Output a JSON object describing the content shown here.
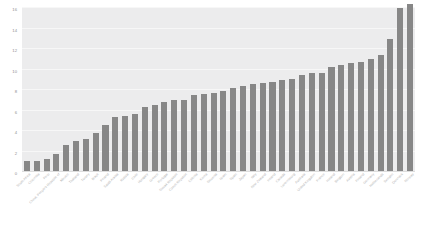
{
  "chart_data": {
    "type": "bar",
    "title": "",
    "subtitle": "",
    "xlabel": "",
    "ylabel": "",
    "ylim": [
      0,
      16
    ],
    "yticks": [
      0,
      2,
      4,
      6,
      8,
      10,
      12,
      14,
      16
    ],
    "grid": true,
    "legend": false,
    "legend_position": "none",
    "orientation": "vertical",
    "sorted": "ascending",
    "bar_color": "#878787",
    "panel_color": "#ececed",
    "gridline_color": "#f7f7f7",
    "tick_label_color": "#b4b4b4",
    "x_label_rotation": -45,
    "categories": [
      "South Africa",
      "Colombia",
      "Peru",
      "China, People's Republic of",
      "Mexico",
      "Thailand",
      "Turkey",
      "Brazil",
      "Poland",
      "Saudi Arabia",
      "Russia",
      "Chile",
      "Hungary",
      "Greece",
      "Portugal",
      "Slovak Republic",
      "Czech Republic",
      "Estonia",
      "Korea",
      "Slovenia",
      "Israel",
      "Spain",
      "Japan",
      "Italy",
      "New Zealand",
      "Ireland",
      "Canada",
      "Luxembourg",
      "Australia",
      "United Kingdom",
      "France",
      "Iceland",
      "Belgium",
      "Austria",
      "Finland",
      "Germany",
      "Netherlands",
      "Sweden",
      "Denmark",
      "Norway"
    ],
    "values": [
      1.1,
      1.1,
      1.3,
      1.8,
      2.6,
      3.0,
      3.2,
      3.8,
      4.6,
      5.4,
      5.5,
      5.7,
      6.3,
      6.5,
      6.8,
      7.0,
      7.0,
      7.5,
      7.6,
      7.7,
      7.9,
      8.2,
      8.4,
      8.6,
      8.7,
      8.8,
      9.0,
      9.1,
      9.5,
      9.7,
      9.7,
      10.2,
      10.4,
      10.6,
      10.7,
      11.0,
      11.4,
      13.0,
      16.0,
      16.4
    ]
  }
}
